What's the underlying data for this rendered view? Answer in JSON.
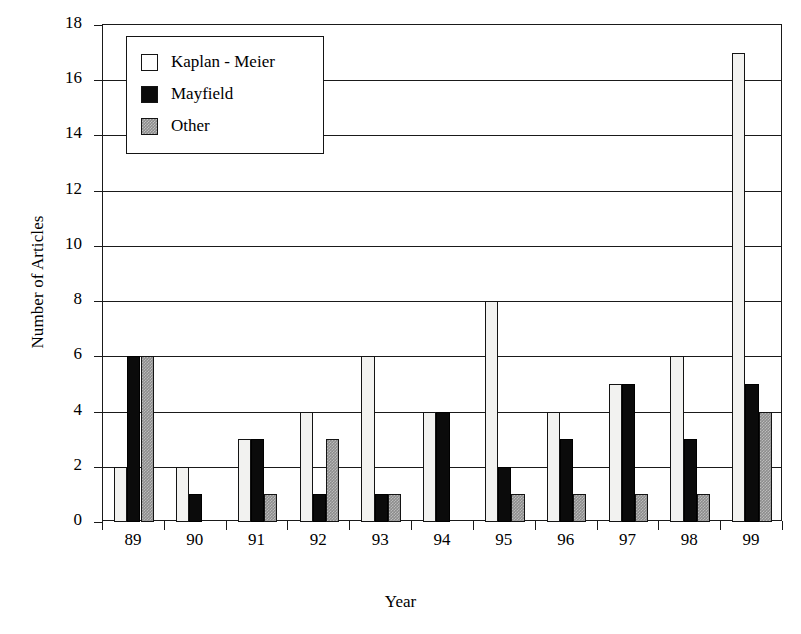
{
  "chart_data": {
    "type": "bar",
    "title": "",
    "subtitle": "",
    "xlabel": "Year",
    "ylabel": "Number of Articles",
    "categories": [
      "89",
      "90",
      "91",
      "92",
      "93",
      "94",
      "95",
      "96",
      "97",
      "98",
      "99"
    ],
    "series": [
      {
        "name": "Kaplan - Meier",
        "color": "#f2f2f0",
        "values": [
          2,
          2,
          3,
          4,
          6,
          4,
          8,
          4,
          5,
          6,
          17
        ]
      },
      {
        "name": "Mayfield",
        "color": "#0b0b0b",
        "values": [
          6,
          1,
          3,
          1,
          1,
          4,
          2,
          3,
          5,
          3,
          5
        ]
      },
      {
        "name": "Other",
        "color": "#8d8d8d",
        "values": [
          6,
          0,
          1,
          3,
          1,
          0,
          1,
          1,
          1,
          1,
          4
        ]
      }
    ],
    "ylim": [
      0,
      18
    ],
    "yticks": [
      0,
      2,
      4,
      6,
      8,
      10,
      12,
      14,
      16,
      18
    ],
    "ytick_labels": [
      "0",
      "2",
      "4",
      "6",
      "8",
      "10",
      "12",
      "14",
      "16",
      "18"
    ],
    "grid": "horizontal",
    "legend_position": "top-left",
    "legend_entries": [
      "Kaplan - Meier",
      "Mayfield",
      "Other"
    ],
    "annotations": []
  },
  "axes": {
    "y_title": "Number of Articles",
    "x_title": "Year"
  },
  "legend": {
    "items": [
      {
        "label": "Kaplan - Meier",
        "swatch": "open-square-swatch"
      },
      {
        "label": "Mayfield",
        "swatch": "filled-square-swatch"
      },
      {
        "label": "Other",
        "swatch": "hatched-square-swatch"
      }
    ]
  }
}
